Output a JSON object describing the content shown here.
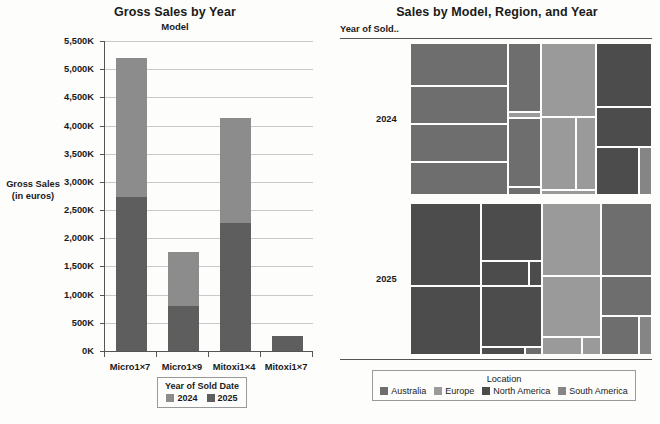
{
  "bar_chart_panel": {
    "title": "Gross Sales by Year",
    "subtitle": "Model",
    "axis_title_line1": "Gross Sales",
    "axis_title_line2": "(in euros)",
    "legend": {
      "title": "Year of Sold Date",
      "items": [
        {
          "label": "2024",
          "color": "#8c8c8c"
        },
        {
          "label": "2025",
          "color": "#5e5e5e"
        }
      ]
    }
  },
  "treemap_panel": {
    "title": "Sales by Model, Region, and Year",
    "row_header": "Year of Sold..",
    "row_labels": [
      "2024",
      "2025"
    ],
    "legend": {
      "title": "Location",
      "items": [
        {
          "label": "Australia",
          "color": "#6e6e6e"
        },
        {
          "label": "Europe",
          "color": "#9a9a9a"
        },
        {
          "label": "North America",
          "color": "#4c4c4c"
        },
        {
          "label": "South America",
          "color": "#858585"
        }
      ]
    }
  },
  "chart_data": [
    {
      "type": "bar",
      "title": "Gross Sales by Year",
      "subtitle": "Model",
      "xlabel": "Model",
      "ylabel": "Gross Sales (in euros)",
      "stacked": true,
      "categories": [
        "Micro1×7",
        "Micro1×9",
        "Mitoxi1×4",
        "Mitoxi1×7"
      ],
      "series": [
        {
          "name": "2025",
          "color": "#5e5e5e",
          "values": [
            2730000,
            790000,
            2280000,
            270000
          ]
        },
        {
          "name": "2024",
          "color": "#8c8c8c",
          "values": [
            2470000,
            970000,
            1850000,
            0
          ]
        }
      ],
      "totals": [
        5200000,
        1760000,
        4130000,
        270000
      ],
      "ylim": [
        0,
        5500000
      ],
      "yticks": [
        0,
        500000,
        1000000,
        1500000,
        2000000,
        2500000,
        3000000,
        3500000,
        4000000,
        4500000,
        5000000,
        5500000
      ],
      "ytick_labels": [
        "0K",
        "500K",
        "1,000K",
        "1,500K",
        "2,000K",
        "2,500K",
        "3,000K",
        "3,500K",
        "4,000K",
        "4,500K",
        "5,000K",
        "5,500K"
      ],
      "grid": true,
      "legend_position": "bottom",
      "legend_title": "Year of Sold Date"
    },
    {
      "type": "treemap",
      "title": "Sales by Model, Region, and Year",
      "row_header": "Year of Sold..",
      "legend_title": "Location",
      "legend_position": "bottom",
      "colors": {
        "Australia": "#6e6e6e",
        "Europe": "#9a9a9a",
        "North America": "#4c4c4c",
        "South America": "#858585"
      },
      "panels": [
        {
          "row": "2024",
          "cells": [
            {
              "location": "Australia",
              "x": 0.0,
              "y": 0.0,
              "w": 0.405,
              "h": 0.285
            },
            {
              "location": "Australia",
              "x": 0.0,
              "y": 0.285,
              "w": 0.405,
              "h": 0.245
            },
            {
              "location": "Australia",
              "x": 0.0,
              "y": 0.53,
              "w": 0.405,
              "h": 0.255
            },
            {
              "location": "Australia",
              "x": 0.0,
              "y": 0.785,
              "w": 0.405,
              "h": 0.215
            },
            {
              "location": "Australia",
              "x": 0.405,
              "y": 0.0,
              "w": 0.135,
              "h": 0.455
            },
            {
              "location": "Europe",
              "x": 0.405,
              "y": 0.455,
              "w": 0.135,
              "h": 0.04
            },
            {
              "location": "Australia",
              "x": 0.405,
              "y": 0.495,
              "w": 0.135,
              "h": 0.455
            },
            {
              "location": "Australia",
              "x": 0.405,
              "y": 0.95,
              "w": 0.135,
              "h": 0.05
            },
            {
              "location": "Europe",
              "x": 0.54,
              "y": 0.0,
              "w": 0.23,
              "h": 0.49
            },
            {
              "location": "Europe",
              "x": 0.54,
              "y": 0.49,
              "w": 0.145,
              "h": 0.475
            },
            {
              "location": "Europe",
              "x": 0.685,
              "y": 0.49,
              "w": 0.085,
              "h": 0.475
            },
            {
              "location": "Europe",
              "x": 0.54,
              "y": 0.965,
              "w": 0.23,
              "h": 0.035
            },
            {
              "location": "North America",
              "x": 0.77,
              "y": 0.0,
              "w": 0.23,
              "h": 0.42
            },
            {
              "location": "North America",
              "x": 0.77,
              "y": 0.42,
              "w": 0.23,
              "h": 0.265
            },
            {
              "location": "North America",
              "x": 0.77,
              "y": 0.685,
              "w": 0.175,
              "h": 0.315
            },
            {
              "location": "South America",
              "x": 0.945,
              "y": 0.685,
              "w": 0.055,
              "h": 0.315
            }
          ]
        },
        {
          "row": "2025",
          "cells": [
            {
              "location": "North America",
              "x": 0.0,
              "y": 0.0,
              "w": 0.295,
              "h": 0.545
            },
            {
              "location": "North America",
              "x": 0.0,
              "y": 0.545,
              "w": 0.295,
              "h": 0.455
            },
            {
              "location": "North America",
              "x": 0.295,
              "y": 0.0,
              "w": 0.25,
              "h": 0.38
            },
            {
              "location": "North America",
              "x": 0.295,
              "y": 0.38,
              "w": 0.195,
              "h": 0.165
            },
            {
              "location": "North America",
              "x": 0.49,
              "y": 0.38,
              "w": 0.055,
              "h": 0.165
            },
            {
              "location": "North America",
              "x": 0.295,
              "y": 0.545,
              "w": 0.25,
              "h": 0.4
            },
            {
              "location": "North America",
              "x": 0.295,
              "y": 0.945,
              "w": 0.18,
              "h": 0.055
            },
            {
              "location": "Australia",
              "x": 0.475,
              "y": 0.945,
              "w": 0.07,
              "h": 0.055
            },
            {
              "location": "Europe",
              "x": 0.545,
              "y": 0.0,
              "w": 0.245,
              "h": 0.48
            },
            {
              "location": "Europe",
              "x": 0.545,
              "y": 0.48,
              "w": 0.245,
              "h": 0.4
            },
            {
              "location": "Europe",
              "x": 0.545,
              "y": 0.88,
              "w": 0.165,
              "h": 0.12
            },
            {
              "location": "Europe",
              "x": 0.71,
              "y": 0.88,
              "w": 0.08,
              "h": 0.12
            },
            {
              "location": "Australia",
              "x": 0.79,
              "y": 0.0,
              "w": 0.21,
              "h": 0.48
            },
            {
              "location": "Australia",
              "x": 0.79,
              "y": 0.48,
              "w": 0.21,
              "h": 0.265
            },
            {
              "location": "Australia",
              "x": 0.79,
              "y": 0.745,
              "w": 0.155,
              "h": 0.255
            },
            {
              "location": "South America",
              "x": 0.945,
              "y": 0.745,
              "w": 0.055,
              "h": 0.255
            }
          ]
        }
      ]
    }
  ]
}
